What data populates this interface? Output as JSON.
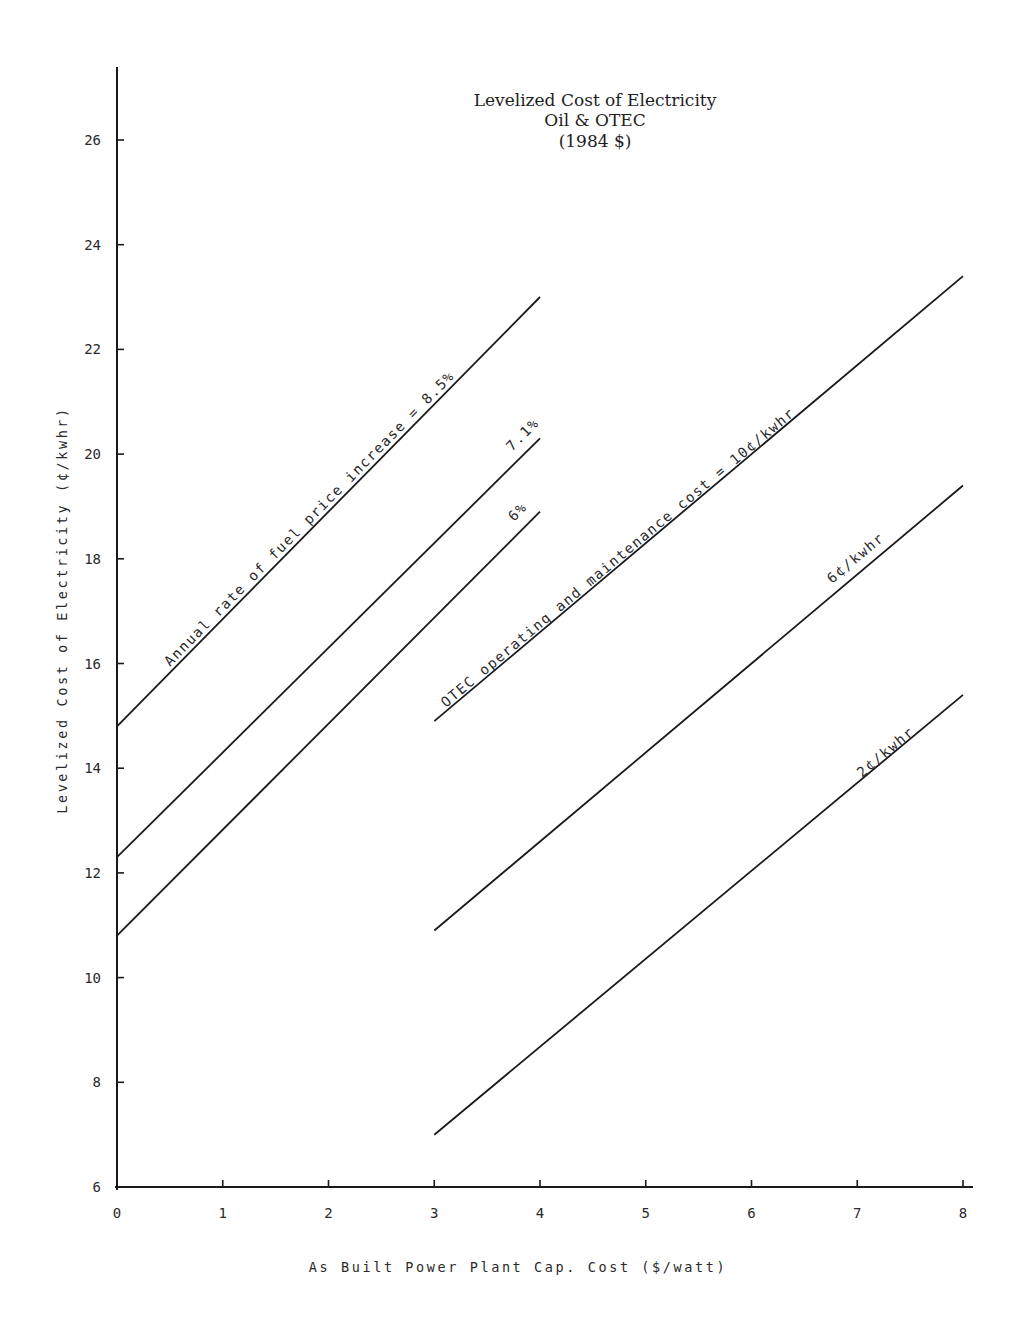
{
  "chart_data": {
    "type": "line",
    "title": "Levelized Cost of Electricity",
    "subtitle_lines": [
      "Oil & OTEC",
      "(1984 $)"
    ],
    "xlabel": "As Built Power Plant Cap. Cost ($/watt)",
    "ylabel": "Levelized Cost of Electricity (¢/kwhr)",
    "xlim": [
      0,
      8
    ],
    "ylim": [
      6,
      27
    ],
    "x_ticks": [
      0,
      1,
      2,
      3,
      4,
      5,
      6,
      7,
      8
    ],
    "y_ticks": [
      6,
      8,
      10,
      12,
      14,
      16,
      18,
      20,
      22,
      24,
      26
    ],
    "grid": false,
    "legend": "none (lines labeled inline)",
    "series": [
      {
        "name": "Oil – annual rate of fuel price increase = 8.5%",
        "group": "Oil",
        "label": "Annual rate of fuel price increase = 8.5%",
        "x": [
          0,
          4
        ],
        "y": [
          14.8,
          23.0
        ]
      },
      {
        "name": "Oil – 7.1%",
        "group": "Oil",
        "label": "7.1%",
        "x": [
          0,
          4
        ],
        "y": [
          12.3,
          20.3
        ]
      },
      {
        "name": "Oil – 6%",
        "group": "Oil",
        "label": "6%",
        "x": [
          0,
          4
        ],
        "y": [
          10.8,
          18.9
        ]
      },
      {
        "name": "OTEC – O&M cost = 10¢/kwhr",
        "group": "OTEC",
        "label": "OTEC operating and maintenance cost = 10¢/kwhr",
        "x": [
          3,
          8
        ],
        "y": [
          14.9,
          23.4
        ]
      },
      {
        "name": "OTEC – 6¢/kwhr",
        "group": "OTEC",
        "label": "6¢/kwhr",
        "x": [
          3,
          8
        ],
        "y": [
          10.9,
          19.4
        ]
      },
      {
        "name": "OTEC – 2¢/kwhr",
        "group": "OTEC",
        "label": "2¢/kwhr",
        "x": [
          3,
          8
        ],
        "y": [
          7.0,
          15.4
        ]
      }
    ]
  },
  "title": {
    "line1": "Levelized Cost of Electricity",
    "line2": "Oil & OTEC",
    "line3": "(1984 $)"
  },
  "axes": {
    "x_title": "As Built Power Plant Cap. Cost ($/watt)",
    "y_title": "Levelized Cost of Electricity (¢/kwhr)",
    "x_tick_labels": [
      "0",
      "1",
      "2",
      "3",
      "4",
      "5",
      "6",
      "7",
      "8"
    ],
    "y_tick_labels": [
      "6",
      "8",
      "10",
      "12",
      "14",
      "16",
      "18",
      "20",
      "22",
      "24",
      "26"
    ]
  },
  "labels": {
    "oil_85": "Annual rate of fuel price increase = 8.5%",
    "oil_71": "7.1%",
    "oil_6": "6%",
    "otec_10": "OTEC operating and maintenance cost = 10¢/kwhr",
    "otec_6": "6¢/kwhr",
    "otec_2": "2¢/kwhr"
  },
  "colors": {
    "ink": "#1a1a1a",
    "paper": "#ffffff"
  }
}
